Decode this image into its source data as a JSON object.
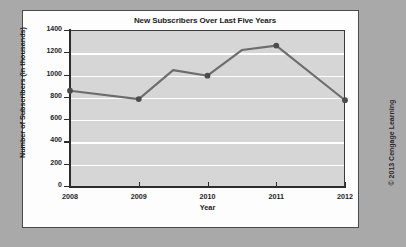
{
  "credit": "© 2013 Cengage Learning",
  "chart_data": {
    "type": "line",
    "title": "New Subscribers Over Last Five Years",
    "xlabel": "Year",
    "ylabel": "Number of Subscribers (in thousands)",
    "categories": [
      "2008",
      "2009",
      "2010",
      "2011",
      "2012"
    ],
    "x": [
      2008,
      2009,
      2010,
      2011,
      2012
    ],
    "values": [
      855,
      780,
      990,
      1260,
      770
    ],
    "vertices": [
      {
        "x": 2008,
        "y": 855,
        "marker": true
      },
      {
        "x": 2009,
        "y": 780,
        "marker": true
      },
      {
        "x": 2009.5,
        "y": 1040,
        "marker": false
      },
      {
        "x": 2010,
        "y": 990,
        "marker": true
      },
      {
        "x": 2010.5,
        "y": 1220,
        "marker": false
      },
      {
        "x": 2011,
        "y": 1260,
        "marker": true
      },
      {
        "x": 2012,
        "y": 770,
        "marker": true
      }
    ],
    "xlim": [
      2008,
      2012
    ],
    "ylim": [
      0,
      1400
    ],
    "yticks": [
      0,
      200,
      400,
      600,
      800,
      1000,
      1200,
      1400
    ],
    "ytick_labels": [
      "0",
      "200",
      "400",
      "600",
      "800",
      "1000",
      "1200",
      "1400"
    ],
    "xticks": [
      2008,
      2009,
      2010,
      2011,
      2012
    ],
    "xtick_labels": [
      "2008",
      "2009",
      "2010",
      "2011",
      "2012"
    ],
    "grid": true,
    "grid_axis": "y",
    "legend": false,
    "colors": {
      "line": "#6d6d6d",
      "marker": "#4c4c4c",
      "plot_background": "#d6d6d6",
      "gridline": "#ffffff",
      "axis": "#2c2c2c",
      "card_background": "#fdfdfd",
      "page_background": "#a9a9a9",
      "text": "#1c1c1c"
    }
  }
}
